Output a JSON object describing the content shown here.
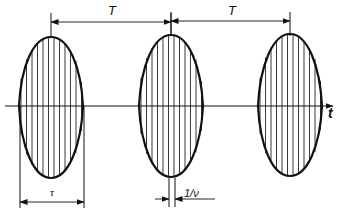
{
  "diagram": {
    "colors": {
      "stroke": "#111111",
      "fill_lines": "#222222",
      "background": "#ffffff"
    },
    "axis": {
      "y": 106,
      "x_start": 5,
      "x_end": 333,
      "label": "t",
      "label_pos": [
        328,
        106
      ]
    },
    "pulses": [
      {
        "cx": 51,
        "half_width": 32,
        "top": 37,
        "bottom": 178
      },
      {
        "cx": 171,
        "half_width": 32,
        "top": 35,
        "bottom": 177
      },
      {
        "cx": 290,
        "half_width": 32,
        "top": 34,
        "bottom": 176
      }
    ],
    "carrier": {
      "spacing": 5.5
    },
    "dimensions": {
      "period_T": [
        {
          "label": "T",
          "x1": 51,
          "x2": 171,
          "y": 22,
          "tick_top": 13,
          "label_pos": [
            108,
            4
          ]
        },
        {
          "label": "T",
          "x1": 171,
          "x2": 290,
          "y": 21,
          "tick_top": 12,
          "label_pos": [
            228,
            4
          ]
        }
      ],
      "pulse_width_tau": {
        "label": "τ",
        "x1": 20,
        "x2": 84,
        "y": 202,
        "ext_top": 106,
        "label_pos": [
          50,
          187
        ]
      },
      "carrier_period": {
        "label": "1/ν",
        "x1": 169,
        "x2": 175,
        "y": 199,
        "ext_top": 178,
        "ext_bottom": 207,
        "line_end": 208,
        "label_pos": [
          184,
          188
        ]
      }
    }
  }
}
